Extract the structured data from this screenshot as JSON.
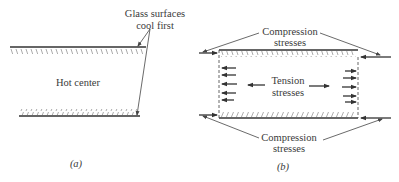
{
  "figure": {
    "panel_a": {
      "label_surfaces_line1": "Glass surfaces",
      "label_surfaces_line2": "cool first",
      "label_center": "Hot center",
      "caption": "(a)"
    },
    "panel_b": {
      "top_label_line1": "Compression",
      "top_label_line2": "stresses",
      "center_label_line1": "Tension",
      "center_label_line2": "stresses",
      "bottom_label_line1": "Compression",
      "bottom_label_line2": "stresses",
      "caption": "(b)"
    }
  },
  "colors": {
    "line": "#333333",
    "hatch": "#888888",
    "text": "#3a3a3a",
    "background": "#ffffff"
  }
}
